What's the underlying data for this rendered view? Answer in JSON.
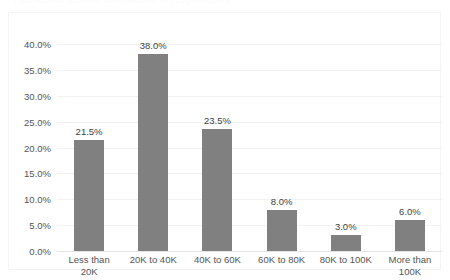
{
  "top_fragment": {
    "text": "Household income distribution of respondents"
  },
  "colors": {
    "bar": "#808080",
    "gridline": "#f2f2f2",
    "axis_text": "#555555",
    "data_label_text": "#3f3f3f",
    "frame_border": "#f4f4f4",
    "background": "#ffffff"
  },
  "chart_data": {
    "type": "bar",
    "title": "",
    "subtitle": "",
    "xlabel": "",
    "ylabel": "",
    "categories": [
      "Less than 20K",
      "20K to 40K",
      "40K to 60K",
      "60K to 80K",
      "80K to 100K",
      "More than 100K"
    ],
    "values": [
      21.5,
      38.0,
      23.5,
      8.0,
      3.0,
      6.0
    ],
    "data_labels": [
      "21.5%",
      "38.0%",
      "23.5%",
      "8.0%",
      "3.0%",
      "6.0%"
    ],
    "ylim": [
      0,
      40
    ],
    "ytick_values": [
      0,
      5,
      10,
      15,
      20,
      25,
      30,
      35,
      40
    ],
    "ytick_labels": [
      "0.0%",
      "5.0%",
      "10.0%",
      "15.0%",
      "20.0%",
      "25.0%",
      "30.0%",
      "35.0%",
      "40.0%"
    ],
    "grid": true,
    "grid_axis": "y",
    "legend": false,
    "legend_position": "none",
    "series": [
      {
        "name": "Percent of respondents",
        "values": [
          21.5,
          38.0,
          23.5,
          8.0,
          3.0,
          6.0
        ]
      }
    ]
  }
}
